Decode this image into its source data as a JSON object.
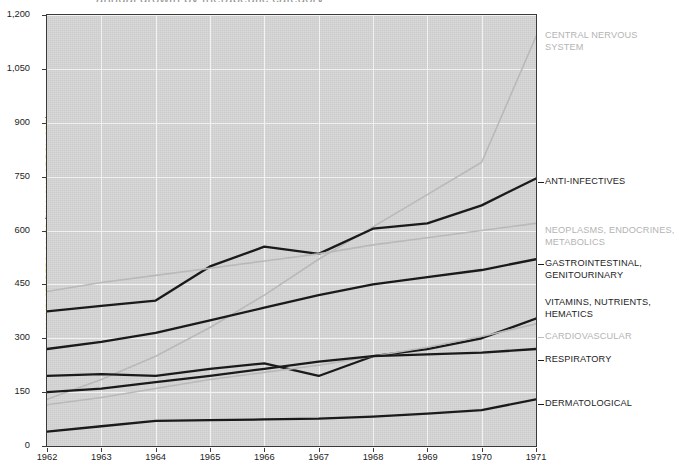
{
  "title_sliver": "annual growth by therapeutic category",
  "axes": {
    "y_title": "MANUFACTURERS' SALES (MILLIONS OF DOLLARS)",
    "y_ticks": [
      "0",
      "150",
      "300",
      "450",
      "600",
      "750",
      "900",
      "1,050",
      "1,200"
    ],
    "x_ticks": [
      "1962",
      "1963",
      "1964",
      "1965",
      "1966",
      "1967",
      "1968",
      "1969",
      "1970",
      "1971"
    ]
  },
  "series_labels": [
    {
      "name": "central-nervous-system",
      "text": "CENTRAL NERVOUS\nSYSTEM",
      "tone": "light"
    },
    {
      "name": "anti-infectives",
      "text": "ANTI-INFECTIVES",
      "tone": "dark"
    },
    {
      "name": "neoplasms-endocrines-metabolics",
      "text": "NEOPLASMS, ENDOCRINES,\nMETABOLICS",
      "tone": "light"
    },
    {
      "name": "gastrointestinal-genitourinary",
      "text": "GASTROINTESTINAL,\nGENITOURINARY",
      "tone": "dark"
    },
    {
      "name": "vitamins-nutrients-hematics",
      "text": "VITAMINS, NUTRIENTS,\nHEMATICS",
      "tone": "dark"
    },
    {
      "name": "cardiovascular",
      "text": "CARDIOVASCULAR",
      "tone": "light"
    },
    {
      "name": "respiratory",
      "text": "RESPIRATORY",
      "tone": "dark"
    },
    {
      "name": "dermatological",
      "text": "DERMATOLOGICAL",
      "tone": "dark"
    }
  ],
  "colors": {
    "plot_background": "#d5d5d5",
    "gridline": "#f2f2f2",
    "frame": "#3a3a3a",
    "dark_series": "#1a1a1a",
    "light_series": "#b9b9b9",
    "text": "#1d1d1d",
    "light_text": "#b4b4b4"
  },
  "chart_data": {
    "type": "line",
    "title": "",
    "xlabel": "",
    "ylabel": "MANUFACTURERS' SALES (MILLIONS OF DOLLARS)",
    "x": [
      1962,
      1963,
      1964,
      1965,
      1966,
      1967,
      1968,
      1969,
      1970,
      1971
    ],
    "xlim": [
      1962,
      1971
    ],
    "ylim": [
      0,
      1200
    ],
    "yticks": [
      0,
      150,
      300,
      450,
      600,
      750,
      900,
      1050,
      1200
    ],
    "grid": true,
    "legend": "right-inline-labels",
    "series": [
      {
        "name": "CENTRAL NERVOUS SYSTEM",
        "tone": "light",
        "values": [
          130,
          185,
          250,
          330,
          420,
          520,
          610,
          700,
          790,
          1140
        ]
      },
      {
        "name": "ANTI-INFECTIVES",
        "tone": "dark",
        "values": [
          375,
          390,
          405,
          500,
          555,
          535,
          605,
          620,
          670,
          745
        ]
      },
      {
        "name": "NEOPLASMS, ENDOCRINES, METABOLICS",
        "tone": "light",
        "values": [
          430,
          455,
          475,
          495,
          515,
          535,
          560,
          580,
          600,
          620
        ]
      },
      {
        "name": "GASTROINTESTINAL, GENITOURINARY",
        "tone": "dark",
        "values": [
          270,
          290,
          315,
          350,
          385,
          420,
          450,
          470,
          490,
          520
        ]
      },
      {
        "name": "VITAMINS, NUTRIENTS, HEMATICS",
        "tone": "dark",
        "values": [
          195,
          200,
          195,
          215,
          230,
          195,
          250,
          270,
          300,
          355
        ]
      },
      {
        "name": "CARDIOVASCULAR",
        "tone": "light",
        "values": [
          115,
          135,
          160,
          185,
          205,
          225,
          250,
          275,
          305,
          340
        ]
      },
      {
        "name": "RESPIRATORY",
        "tone": "dark",
        "values": [
          150,
          160,
          178,
          195,
          215,
          235,
          250,
          255,
          260,
          270
        ]
      },
      {
        "name": "DERMATOLOGICAL",
        "tone": "dark",
        "values": [
          40,
          55,
          70,
          72,
          74,
          76,
          82,
          90,
          100,
          130
        ]
      }
    ]
  }
}
